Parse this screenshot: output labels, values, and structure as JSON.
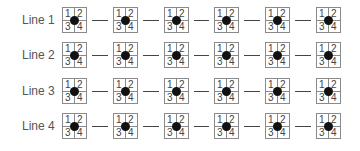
{
  "rows": [
    {
      "label": "Line 1"
    },
    {
      "label": "Line 2"
    },
    {
      "label": "Line 3"
    },
    {
      "label": "Line 4"
    }
  ],
  "quadrants": [
    "1",
    "2",
    "3",
    "4"
  ],
  "boxes_per_row": 6,
  "colors": {
    "border": "#8a8a8a",
    "dot": "#111111",
    "connector": "#444444",
    "text": "#555555"
  }
}
